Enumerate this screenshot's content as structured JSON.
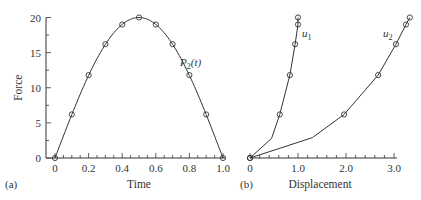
{
  "chart_data": [
    {
      "type": "line",
      "panel_label": "(a)",
      "title": "",
      "xlabel": "Time",
      "ylabel": "Force",
      "xlim": [
        0,
        1.0
      ],
      "ylim": [
        0,
        20
      ],
      "x_ticks": [
        "0",
        "0.2",
        "0.4",
        "0.6",
        "0.8",
        "1.0"
      ],
      "y_ticks": [
        "0",
        "5",
        "10",
        "15",
        "20"
      ],
      "grid": false,
      "series": [
        {
          "name": "P2(t)",
          "label_main": "P",
          "label_sub": "2",
          "label_suffix": "(t)",
          "marker": "circle",
          "x": [
            0,
            0.1,
            0.2,
            0.3,
            0.4,
            0.5,
            0.6,
            0.7,
            0.8,
            0.9,
            1.0
          ],
          "y": [
            0,
            6.2,
            11.8,
            16.2,
            19.0,
            20.0,
            19.0,
            16.2,
            11.8,
            6.2,
            0
          ]
        }
      ]
    },
    {
      "type": "line",
      "panel_label": "(b)",
      "title": "",
      "xlabel": "Displacement",
      "ylabel": "Force",
      "xlim": [
        0,
        3.0
      ],
      "ylim": [
        0,
        20
      ],
      "x_ticks": [
        "0",
        "1.0",
        "2.0",
        "3.0"
      ],
      "grid": false,
      "series": [
        {
          "name": "u1",
          "label_main": "u",
          "label_sub": "1",
          "marker": "circle",
          "x": [
            0,
            0.45,
            0.62,
            0.83,
            0.94,
            1.0,
            1.0
          ],
          "y": [
            0,
            2.8,
            6.2,
            11.8,
            16.2,
            19.0,
            20.0
          ]
        },
        {
          "name": "u2",
          "label_main": "u",
          "label_sub": "2",
          "marker": "circle",
          "x": [
            0,
            1.3,
            1.96,
            2.67,
            3.04,
            3.25,
            3.33
          ],
          "y": [
            0,
            2.9,
            6.2,
            11.8,
            16.2,
            19.0,
            20.0
          ]
        }
      ]
    }
  ]
}
